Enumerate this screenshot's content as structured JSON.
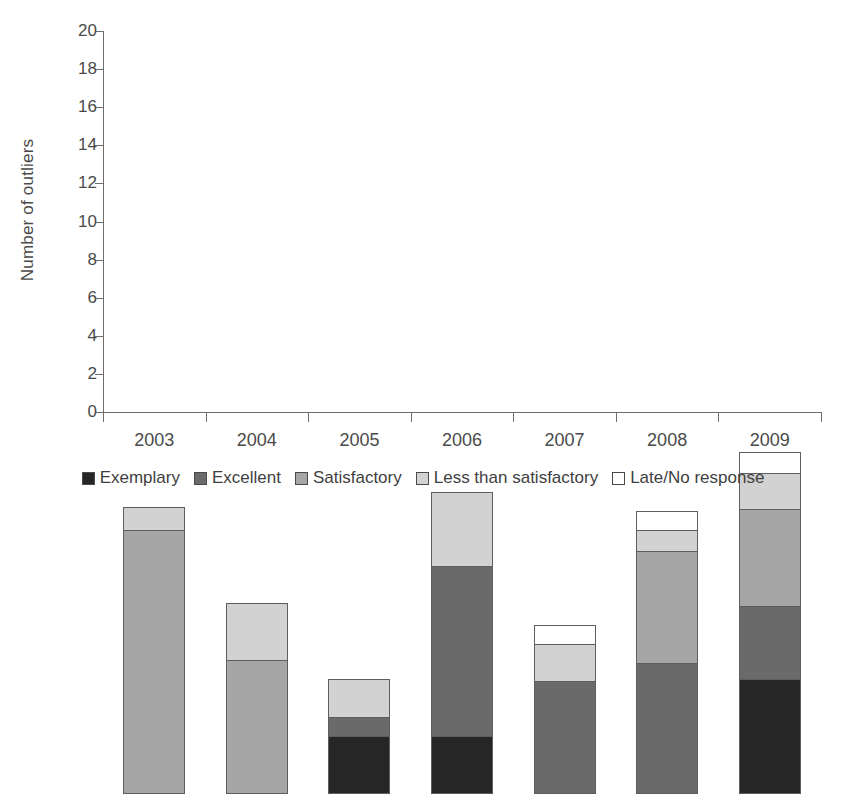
{
  "chart_data": {
    "type": "bar",
    "stacked": true,
    "title": "",
    "xlabel": "",
    "ylabel": "Number of outliers",
    "categories": [
      "2003",
      "2004",
      "2005",
      "2006",
      "2007",
      "2008",
      "2009"
    ],
    "ylim": [
      0,
      20
    ],
    "yticks": [
      0,
      2,
      4,
      6,
      8,
      10,
      12,
      14,
      16,
      18,
      20
    ],
    "grid": false,
    "legend_position": "bottom",
    "series": [
      {
        "name": "Exemplary",
        "color": "#262626",
        "values": [
          0,
          0,
          3.0,
          3.0,
          0,
          0,
          6.0
        ]
      },
      {
        "name": "Excellent",
        "color": "#6a6a6a",
        "values": [
          0,
          0,
          1.0,
          8.9,
          5.9,
          6.8,
          3.8
        ]
      },
      {
        "name": "Satisfactory",
        "color": "#a6a6a6",
        "values": [
          13.8,
          7.0,
          0,
          0,
          0,
          5.9,
          5.1
        ]
      },
      {
        "name": "Less than satisfactory",
        "color": "#d2d2d2",
        "values": [
          1.2,
          3.0,
          2.0,
          3.9,
          1.9,
          1.1,
          1.9
        ]
      },
      {
        "name": "Late/No response",
        "color": "#ffffff",
        "values": [
          0,
          0,
          0,
          0,
          1.0,
          1.0,
          1.1
        ]
      }
    ],
    "totals": [
      15.0,
      10.0,
      6.0,
      15.8,
      8.8,
      14.8,
      17.8
    ]
  }
}
